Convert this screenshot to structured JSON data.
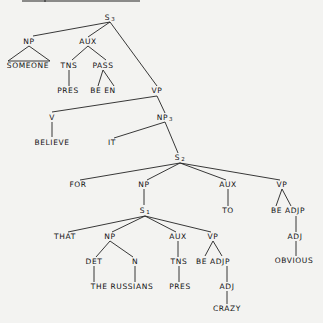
{
  "diagram": {
    "type": "syntax-tree",
    "background": "#f3f3f1",
    "line_color": "#222222",
    "header_bar": {
      "x1": 22,
      "x2": 140,
      "y": 1,
      "tick_x": 45
    },
    "nodes": [
      {
        "id": "s3",
        "label": "S",
        "sub": "3",
        "x": 110,
        "y": 18
      },
      {
        "id": "np_someone",
        "label": "NP",
        "x": 29,
        "y": 42
      },
      {
        "id": "aux_top",
        "label": "AUX",
        "x": 88,
        "y": 42
      },
      {
        "id": "someone",
        "label": "SOMEONE",
        "x": 28,
        "y": 66
      },
      {
        "id": "tns_top",
        "label": "TNS",
        "x": 69,
        "y": 66
      },
      {
        "id": "pass",
        "label": "PASS",
        "x": 103,
        "y": 66
      },
      {
        "id": "pres_top",
        "label": "PRES",
        "x": 68,
        "y": 91
      },
      {
        "id": "be_en",
        "label": "BE EN",
        "x": 103,
        "y": 91
      },
      {
        "id": "vp_top",
        "label": "VP",
        "x": 157,
        "y": 91
      },
      {
        "id": "v",
        "label": "V",
        "x": 52,
        "y": 118
      },
      {
        "id": "np3",
        "label": "NP",
        "sub": "3",
        "x": 165,
        "y": 118
      },
      {
        "id": "believe",
        "label": "BELIEVE",
        "x": 52,
        "y": 143
      },
      {
        "id": "it",
        "label": "IT",
        "x": 112,
        "y": 143
      },
      {
        "id": "s2",
        "label": "S",
        "sub": "2",
        "x": 180,
        "y": 158
      },
      {
        "id": "for",
        "label": "FOR",
        "x": 78,
        "y": 185
      },
      {
        "id": "np_s1",
        "label": "NP",
        "x": 144,
        "y": 185
      },
      {
        "id": "aux_to",
        "label": "AUX",
        "x": 228,
        "y": 185
      },
      {
        "id": "vp_obv",
        "label": "VP",
        "x": 282,
        "y": 185
      },
      {
        "id": "s1",
        "label": "S",
        "sub": "1",
        "x": 145,
        "y": 211
      },
      {
        "id": "to",
        "label": "TO",
        "x": 228,
        "y": 211
      },
      {
        "id": "be_adjp_r",
        "label": "BE ADJP",
        "x": 288,
        "y": 211
      },
      {
        "id": "that",
        "label": "THAT",
        "x": 65,
        "y": 237
      },
      {
        "id": "np_rus",
        "label": "NP",
        "x": 110,
        "y": 237
      },
      {
        "id": "aux_low",
        "label": "AUX",
        "x": 178,
        "y": 237
      },
      {
        "id": "vp_low",
        "label": "VP",
        "x": 213,
        "y": 237
      },
      {
        "id": "adj_r",
        "label": "ADJ",
        "x": 295,
        "y": 237
      },
      {
        "id": "det",
        "label": "DET",
        "x": 94,
        "y": 262
      },
      {
        "id": "n",
        "label": "N",
        "x": 135,
        "y": 262
      },
      {
        "id": "tns_low",
        "label": "TNS",
        "x": 179,
        "y": 262
      },
      {
        "id": "be_adjp_l",
        "label": "BE ADJP",
        "x": 213,
        "y": 262
      },
      {
        "id": "obvious",
        "label": "OBVIOUS",
        "x": 294,
        "y": 261
      },
      {
        "id": "the_russians",
        "label": "THE RUSSIANS",
        "x": 122,
        "y": 287
      },
      {
        "id": "pres_low",
        "label": "PRES",
        "x": 180,
        "y": 287
      },
      {
        "id": "adj_l",
        "label": "ADJ",
        "x": 227,
        "y": 287
      },
      {
        "id": "crazy",
        "label": "CRAZY",
        "x": 227,
        "y": 309
      }
    ],
    "edges": [
      [
        110,
        22,
        33,
        36
      ],
      [
        110,
        22,
        88,
        37
      ],
      [
        110,
        22,
        157,
        86
      ],
      [
        29,
        46,
        8,
        61
      ],
      [
        29,
        46,
        50,
        61
      ],
      [
        8,
        61,
        50,
        61
      ],
      [
        88,
        46,
        72,
        60
      ],
      [
        88,
        46,
        106,
        60
      ],
      [
        69,
        70,
        69,
        86
      ],
      [
        103,
        70,
        98,
        86
      ],
      [
        103,
        70,
        114,
        86
      ],
      [
        157,
        96,
        52,
        112
      ],
      [
        157,
        96,
        165,
        113
      ],
      [
        52,
        122,
        52,
        137
      ],
      [
        165,
        122,
        114,
        138
      ],
      [
        165,
        122,
        178,
        153
      ],
      [
        180,
        163,
        80,
        180
      ],
      [
        180,
        163,
        147,
        180
      ],
      [
        180,
        163,
        226,
        180
      ],
      [
        180,
        163,
        280,
        180
      ],
      [
        144,
        189,
        144,
        205
      ],
      [
        228,
        189,
        228,
        206
      ],
      [
        282,
        189,
        276,
        206
      ],
      [
        282,
        189,
        291,
        206
      ],
      [
        296,
        216,
        296,
        232
      ],
      [
        145,
        216,
        68,
        232
      ],
      [
        145,
        216,
        112,
        232
      ],
      [
        145,
        216,
        176,
        232
      ],
      [
        145,
        216,
        211,
        232
      ],
      [
        110,
        241,
        96,
        257
      ],
      [
        110,
        241,
        133,
        257
      ],
      [
        178,
        241,
        178,
        257
      ],
      [
        213,
        241,
        205,
        256
      ],
      [
        213,
        241,
        222,
        256
      ],
      [
        296,
        241,
        296,
        256
      ],
      [
        94,
        266,
        94,
        282
      ],
      [
        135,
        266,
        135,
        282
      ],
      [
        179,
        266,
        179,
        282
      ],
      [
        227,
        266,
        227,
        282
      ],
      [
        227,
        291,
        227,
        304
      ]
    ]
  }
}
